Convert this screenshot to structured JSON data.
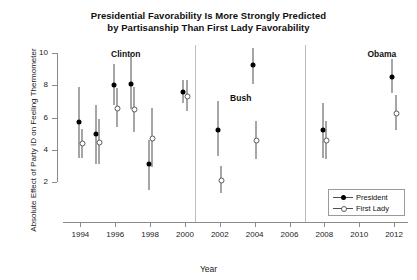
{
  "chart_data": {
    "type": "scatter",
    "title": "Presidential Favorability Is More Strongly Predicted by Partisanship Than First Lady Favorability",
    "title_line1": "Presidential Favorability Is More Strongly Predicted",
    "title_line2": "by Partisanship Than First Lady Favorability",
    "xlabel": "Year",
    "ylabel": "Absolute Effect of Party ID on Feeling Thermometer",
    "xlim": [
      1993.0,
      2012.8
    ],
    "ylim": [
      1.2,
      10.4
    ],
    "yticks": [
      2,
      4,
      6,
      8,
      10
    ],
    "ytick_labels": [
      "2",
      "4",
      "6",
      "8",
      "10"
    ],
    "xticks": [
      1994,
      1996,
      1998,
      2000,
      2002,
      2004,
      2006,
      2008,
      2010,
      2012
    ],
    "xtick_labels": [
      "1994",
      "1996",
      "1998",
      "2000",
      "2002",
      "2004",
      "2006",
      "2008",
      "2010",
      "2012"
    ],
    "grid": false,
    "legend_position": "bottom-right",
    "error_bars": "vertical 95% intervals",
    "series": [
      {
        "name": "President",
        "marker": "filled-circle",
        "color": "#000000",
        "x": [
          1994,
          1995,
          1996,
          1997,
          1998,
          2000,
          2002,
          2004,
          2008,
          2012
        ],
        "values": [
          5.7,
          5.0,
          8.0,
          8.1,
          3.1,
          7.6,
          5.2,
          9.25,
          5.2,
          8.5
        ],
        "err_low": [
          3.5,
          3.1,
          6.8,
          6.5,
          1.5,
          6.9,
          3.6,
          8.1,
          3.5,
          7.5
        ],
        "err_high": [
          7.9,
          6.8,
          9.3,
          10.0,
          4.6,
          8.3,
          7.0,
          10.3,
          6.9,
          9.6
        ]
      },
      {
        "name": "First Lady",
        "marker": "open-circle",
        "color": "#5a5a5a",
        "x": [
          1994,
          1995,
          1996,
          1997,
          1998,
          2000,
          2002,
          2004,
          2008,
          2012
        ],
        "values": [
          4.4,
          4.5,
          6.6,
          6.5,
          4.75,
          7.35,
          2.15,
          4.6,
          4.6,
          6.3
        ],
        "err_low": [
          3.5,
          3.1,
          5.4,
          5.1,
          2.9,
          6.4,
          1.3,
          3.4,
          3.4,
          5.2
        ],
        "err_high": [
          5.3,
          5.9,
          7.8,
          7.9,
          6.6,
          8.3,
          3.0,
          5.8,
          5.8,
          7.4
        ]
      }
    ],
    "era_labels": [
      {
        "text": "Clinton",
        "x": 1996.6,
        "y": 9.95
      },
      {
        "text": "Bush",
        "x": 2003.2,
        "y": 7.2
      },
      {
        "text": "Obama",
        "x": 2011.3,
        "y": 9.95
      }
    ],
    "dividers": [
      2000.55,
      2006.9
    ]
  },
  "legend": {
    "items": [
      {
        "label": "President"
      },
      {
        "label": "First Lady"
      }
    ]
  }
}
